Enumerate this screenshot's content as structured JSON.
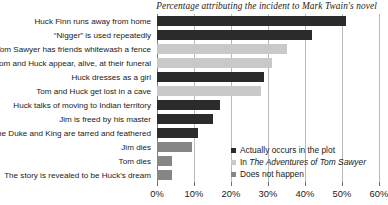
{
  "chart_data": {
    "type": "bar",
    "orientation": "horizontal",
    "title": "",
    "subtitle": "Percentage attributing the incident to Mark Twain's novel",
    "xlabel": "",
    "ylabel": "",
    "xlim": [
      0,
      60
    ],
    "xticks": [
      0,
      10,
      20,
      30,
      40,
      50,
      60
    ],
    "xtick_labels": [
      "0%",
      "10%",
      "20%",
      "30%",
      "40%",
      "50%",
      "60%"
    ],
    "grid": "vertical",
    "legend_position": "inside-bottom-right",
    "categories": [
      "Huck Finn runs away from home",
      "“Nigger” is used repeatedly",
      "Tom Sawyer has friends whitewash a fence",
      "Tom and Huck appear, alive, at their funeral",
      "Huck dresses as a girl",
      "Tom and Huck get lost in a cave",
      "Huck talks of moving to Indian territory",
      "Jim is freed by his master",
      "The Duke and King are tarred and feathered",
      "Jim dies",
      "Tom dies",
      "The story is revealed to be Huck's dream"
    ],
    "values": [
      51,
      42,
      35,
      31,
      29,
      28,
      17,
      15,
      11,
      9.5,
      4,
      4
    ],
    "point_groups": [
      "actually-occurs",
      "actually-occurs",
      "tom-sawyer",
      "tom-sawyer",
      "actually-occurs",
      "tom-sawyer",
      "actually-occurs",
      "actually-occurs",
      "actually-occurs",
      "does-not-happen",
      "does-not-happen",
      "does-not-happen"
    ],
    "series": [
      {
        "name": "Actually occurs in the plot",
        "key": "actually-occurs",
        "color": "#2b2b2b"
      },
      {
        "name": "In The Adventures of Tom Sawyer",
        "key": "tom-sawyer",
        "color": "#c9c9c9"
      },
      {
        "name": "Does not happen",
        "key": "does-not-happen",
        "color": "#868686"
      }
    ]
  },
  "legend": {
    "items": [
      {
        "label": "Actually occurs in the plot",
        "label_plain": "Actually occurs in the plot",
        "label_italic": "",
        "label_tail": "",
        "color": "#2b2b2b"
      },
      {
        "label": "In The Adventures of Tom Sawyer",
        "label_plain": "In ",
        "label_italic": "The Adventures of Tom Sawyer",
        "label_tail": "",
        "color": "#c9c9c9"
      },
      {
        "label": "Does not happen",
        "label_plain": "Does not happen",
        "label_italic": "",
        "label_tail": "",
        "color": "#868686"
      }
    ]
  },
  "colors": {
    "background": "#ffffff",
    "gridline": "#b9b9b9",
    "axis": "#7d7d7d",
    "text": "#1a1a1a"
  }
}
